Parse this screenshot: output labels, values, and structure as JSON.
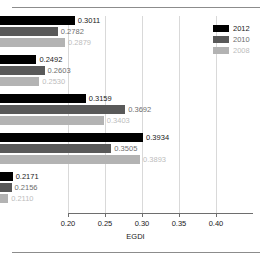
{
  "chart_data": {
    "type": "bar",
    "orientation": "horizontal",
    "title": "",
    "xlabel": "EGDI",
    "ylabel": "",
    "xlim": [
      0.2,
      0.45
    ],
    "xticks": [
      0.2,
      0.25,
      0.3,
      0.35,
      0.4
    ],
    "xtick_labels": [
      "0.20",
      "0.25",
      "0.30",
      "0.35",
      "0.40"
    ],
    "grid": true,
    "grid_axis": "x",
    "legend_position": "top-right",
    "baseline": 0.2,
    "categories": [
      "Eastern Africa",
      "Middle Africa",
      "Northern Africa",
      "Southern  Africa",
      "Western Africa"
    ],
    "series": [
      {
        "name": "2012",
        "color": "#000000",
        "text_color": "#1a1a1a",
        "values": [
          0.3011,
          0.2492,
          0.3159,
          0.3934,
          0.2171
        ],
        "labels": [
          "0.3011",
          "0.2492",
          "0.3159",
          "0.3934",
          "0.2171"
        ]
      },
      {
        "name": "2010",
        "color": "#595959",
        "text_color": "#6e6e6e",
        "values": [
          0.2782,
          0.2603,
          0.3692,
          0.3505,
          0.2156
        ],
        "labels": [
          "0.2782",
          "0.2603",
          "0.3692",
          "0.3505",
          "0.2156"
        ]
      },
      {
        "name": "2008",
        "color": "#b3b3b3",
        "text_color": "#bdbdbd",
        "values": [
          0.2879,
          0.253,
          0.3403,
          0.3893,
          0.211
        ],
        "labels": [
          "0.2879",
          "0.2530",
          "0.3403",
          "0.3893",
          "0.2110"
        ]
      }
    ]
  },
  "legend": {
    "items": [
      {
        "label": "2012",
        "color": "#000000",
        "text_color": "#1a1a1a"
      },
      {
        "label": "2010",
        "color": "#595959",
        "text_color": "#6e6e6e"
      },
      {
        "label": "2008",
        "color": "#b3b3b3",
        "text_color": "#bdbdbd"
      }
    ]
  },
  "axis": {
    "xlabel": "EGDI"
  }
}
